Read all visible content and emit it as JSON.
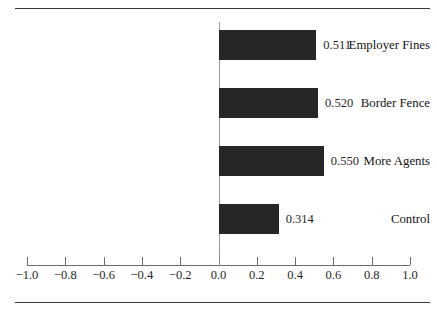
{
  "chart_data": {
    "type": "bar",
    "orientation": "horizontal",
    "title": "",
    "subtitle": "",
    "xlabel": "",
    "ylabel": "",
    "categories": [
      "Employer Fines",
      "Border Fence",
      "More Agents",
      "Control"
    ],
    "values": [
      0.511,
      0.52,
      0.55,
      0.314
    ],
    "value_labels": [
      "0.511",
      "0.520",
      "0.550",
      "0.314"
    ],
    "series": [
      {
        "name": "",
        "values": [
          0.511,
          0.52,
          0.55,
          0.314
        ]
      }
    ],
    "xlim": [
      -1.0,
      1.0
    ],
    "xticks": [
      -1.0,
      -0.8,
      -0.6,
      -0.4,
      -0.2,
      0.0,
      0.2,
      0.4,
      0.6,
      0.8,
      1.0
    ],
    "xtick_labels": [
      "−1.0",
      "−0.8",
      "−0.6",
      "−0.4",
      "−0.2",
      "0.0",
      "0.2",
      "0.4",
      "0.6",
      "0.8",
      "1.0"
    ],
    "grid": false,
    "legend": false,
    "legend_position": "none",
    "zero_baseline": true,
    "bar_color": "#262626",
    "axis_color": "#6b6b6b",
    "rule_color": "#3a3a3a",
    "text_color": "#1a1a1a",
    "background": "#ffffff"
  },
  "figure": {
    "top_rule": "top-rule",
    "bottom_rule": "bottom-rule"
  }
}
